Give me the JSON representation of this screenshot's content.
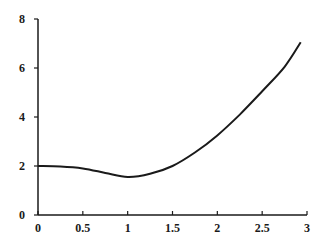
{
  "chart_data": {
    "type": "line",
    "title": "",
    "xlabel": "",
    "ylabel": "",
    "xlim": [
      0,
      3
    ],
    "ylim": [
      0,
      8
    ],
    "grid": false,
    "legend": null,
    "x_ticks": [
      0,
      0.5,
      1,
      1.5,
      2,
      2.5,
      3
    ],
    "x_tick_labels": [
      "0",
      "0.5",
      "1",
      "1.5",
      "2",
      "2.5",
      "3"
    ],
    "y_ticks": [
      0,
      2,
      4,
      6,
      8
    ],
    "y_tick_labels": [
      "0",
      "2",
      "4",
      "6",
      "8"
    ],
    "series": [
      {
        "name": "curve",
        "color": "#1a1a1a",
        "x": [
          0,
          0.25,
          0.5,
          0.75,
          1.0,
          1.25,
          1.5,
          1.75,
          2.0,
          2.25,
          2.5,
          2.75,
          2.93
        ],
        "y": [
          2.0,
          1.98,
          1.9,
          1.72,
          1.55,
          1.68,
          2.0,
          2.55,
          3.25,
          4.1,
          5.05,
          6.05,
          7.05
        ]
      }
    ]
  }
}
